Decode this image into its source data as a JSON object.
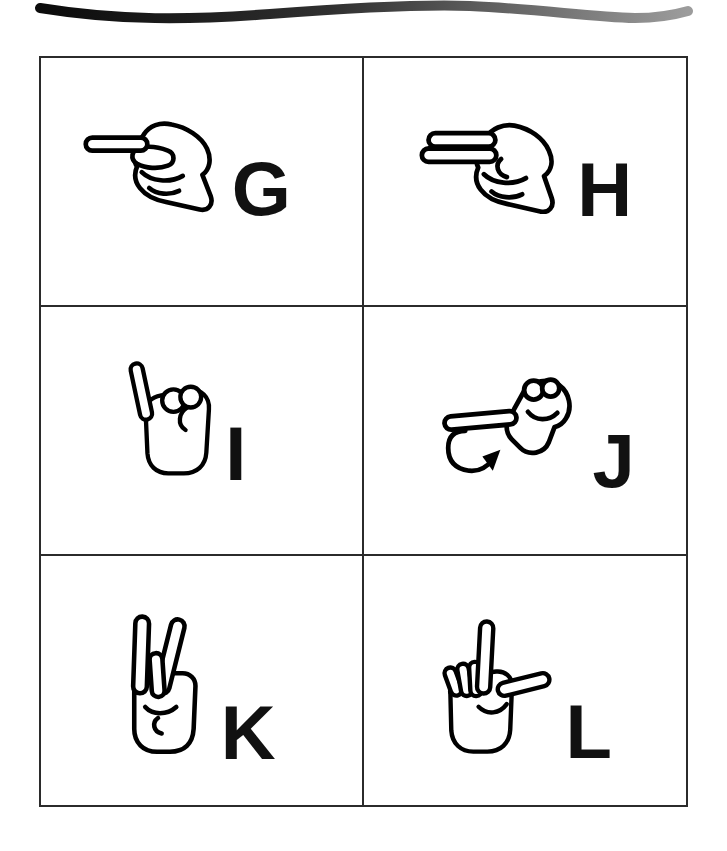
{
  "page": {
    "type": "printed sign-language alphabet page",
    "background_color": "#ffffff",
    "letter_color": "#111111",
    "ribbon": {
      "icon": "decorative-wave-ribbon",
      "gradient_start_color": "#0b0b0b",
      "gradient_end_color": "#9c9c9c"
    },
    "grid": {
      "rows": 3,
      "columns": 2,
      "border_color": "#2b2b2b"
    }
  },
  "cards": [
    {
      "letter": "G",
      "icon": "asl-hand-sign-g"
    },
    {
      "letter": "H",
      "icon": "asl-hand-sign-h"
    },
    {
      "letter": "I",
      "icon": "asl-hand-sign-i"
    },
    {
      "letter": "J",
      "icon": "asl-hand-sign-j",
      "motion_arrow_icon": "j-motion-curve-arrow"
    },
    {
      "letter": "K",
      "icon": "asl-hand-sign-k"
    },
    {
      "letter": "L",
      "icon": "asl-hand-sign-l"
    }
  ]
}
